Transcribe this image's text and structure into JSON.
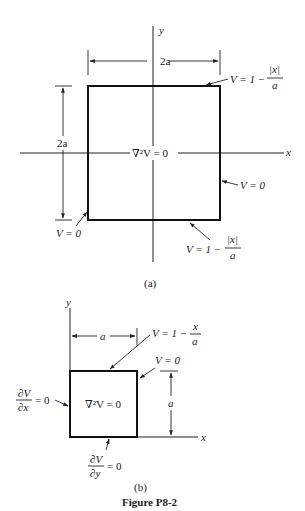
{
  "figure": {
    "caption": "Figure P8-2",
    "colors": {
      "ink": "#111111",
      "background": "#ffffff"
    }
  },
  "part_a": {
    "label": "(a)",
    "axis_x": "x",
    "axis_y": "y",
    "width_dim": "2a",
    "height_dim": "2a",
    "equation": "∇²V = 0",
    "top_bc": {
      "lhs": "V = 1 −",
      "num": "|x|",
      "den": "a"
    },
    "right_bc": "V = 0",
    "left_bc": "V = 0",
    "bottom_bc": {
      "lhs": "V = 1 −",
      "num": "|x|",
      "den": "a"
    }
  },
  "part_b": {
    "label": "(b)",
    "axis_x": "x",
    "axis_y": "y",
    "width_dim": "a",
    "height_dim": "a",
    "equation": "∇²V = 0",
    "top_bc": {
      "lhs": "V = 1 −",
      "num": "x",
      "den": "a"
    },
    "right_bc": "V = 0",
    "left_bc": {
      "num": "∂V",
      "den": "∂x",
      "rhs": "= 0"
    },
    "bottom_bc": {
      "num": "∂V",
      "den": "∂y",
      "rhs": "= 0"
    }
  }
}
